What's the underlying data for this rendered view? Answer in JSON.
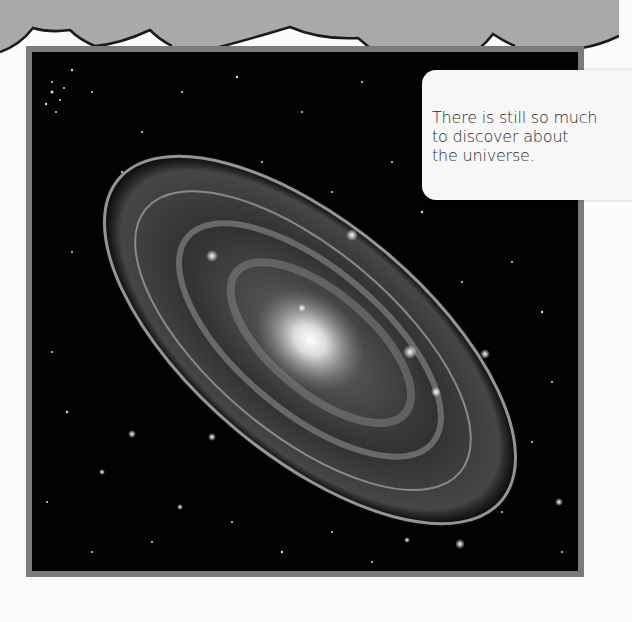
{
  "page": {
    "background": "#fbfbfb",
    "banner_color": "#a9a9a9",
    "frame_color": "#7b7b7b"
  },
  "photo": {
    "subject": "spiral galaxy in starfield",
    "description": "Black-and-white image of a large tilted spiral galaxy with a bright core among many stars"
  },
  "callout": {
    "text": "There is still so much\nto discover about\nthe universe."
  }
}
